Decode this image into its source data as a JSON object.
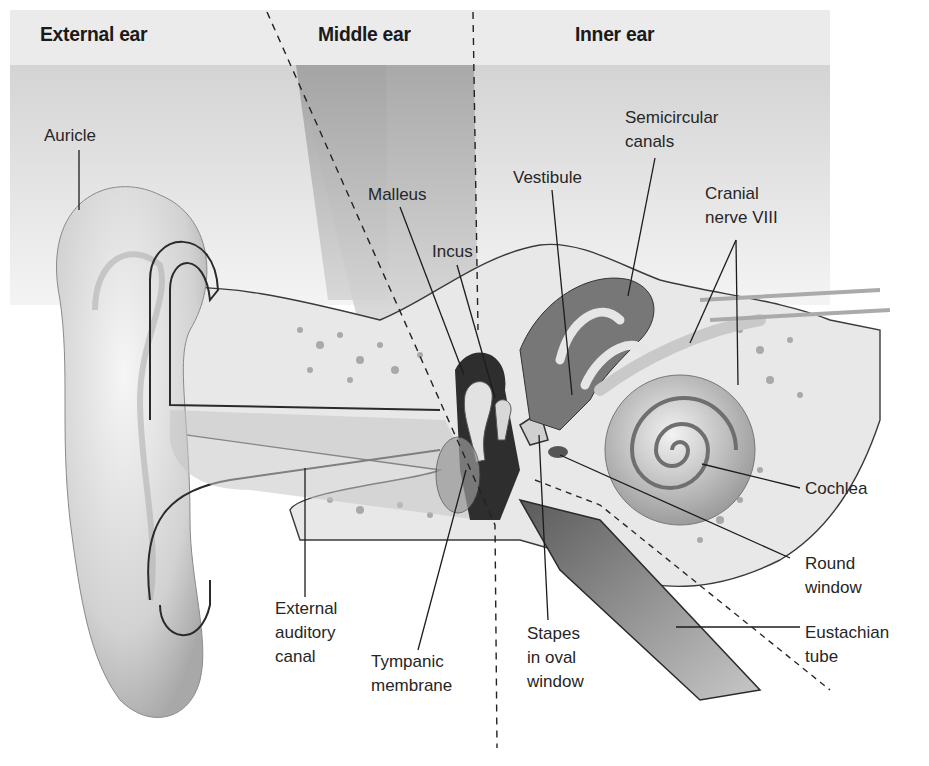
{
  "regions": [
    {
      "id": "external",
      "label": "External ear"
    },
    {
      "id": "middle",
      "label": "Middle ear"
    },
    {
      "id": "inner",
      "label": "Inner ear"
    }
  ],
  "labels": {
    "auricle": "Auricle",
    "malleus": "Malleus",
    "incus": "Incus",
    "vestibule": "Vestibule",
    "semicircular_canals": "Semicircular\ncanals",
    "cranial_nerve": "Cranial\nnerve VIII",
    "cochlea": "Cochlea",
    "round_window": "Round\nwindow",
    "eustachian_tube": "Eustachian\ntube",
    "stapes": "Stapes\nin oval\nwindow",
    "tympanic_membrane": "Tympanic\nmembrane",
    "external_auditory_canal": "External\nauditory\ncanal"
  },
  "colors": {
    "header_band": "#ebebeb",
    "upper_band": "#d6d6d6",
    "middle_wedge": "#a9a9a9",
    "tissue": "#e6e6e6",
    "outline": "#2a2a2a"
  }
}
